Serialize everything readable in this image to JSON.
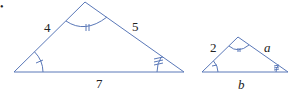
{
  "figure": {
    "bullet": "•",
    "stroke_color": "#5a78b8",
    "large_triangle": {
      "side_left": "4",
      "side_right": "5",
      "side_bottom": "7",
      "angle_marks": {
        "left": 1,
        "apex": 2,
        "right": 3
      }
    },
    "small_triangle": {
      "side_left": "2",
      "side_right": "a",
      "side_bottom": "b",
      "angle_marks": {
        "left": 1,
        "apex": 2,
        "right": 3
      }
    }
  }
}
